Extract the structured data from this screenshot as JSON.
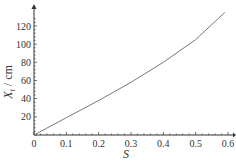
{
  "chart_data": {
    "type": "line",
    "title": "",
    "xlabel": "S",
    "ylabel": "X_t / cm",
    "ylabel_main": "X",
    "ylabel_sub": "t",
    "ylabel_unit": " / cm",
    "xlim": [
      0,
      0.62
    ],
    "ylim": [
      0,
      140
    ],
    "grid": false,
    "legend": "none",
    "x_ticks": [
      "0",
      "0.1",
      "0.2",
      "0.3",
      "0.4",
      "0.5",
      "0.6"
    ],
    "y_ticks": [
      "20",
      "40",
      "60",
      "80",
      "100",
      "120"
    ],
    "series": [
      {
        "name": "X_t",
        "x": [
          0,
          0.1,
          0.2,
          0.3,
          0.4,
          0.5,
          0.59
        ],
        "values": [
          0,
          19,
          38,
          58,
          80,
          105,
          135
        ]
      }
    ],
    "colors": {
      "line": "#777777",
      "axis": "#333333"
    }
  }
}
